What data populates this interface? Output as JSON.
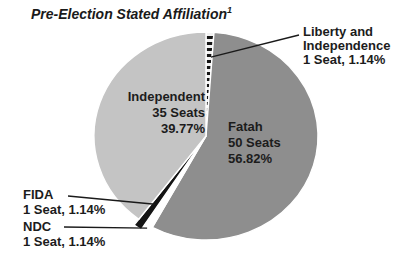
{
  "title": {
    "text": "Pre-Election Stated Affiliation",
    "superscript": "1"
  },
  "chart_data": {
    "type": "pie",
    "title": "Pre-Election Stated Affiliation",
    "footnote_marker": "1",
    "unit": "Seats",
    "total_seats": 88,
    "start_angle_deg": 0,
    "direction": "clockwise",
    "legend_position": "none",
    "slices": [
      {
        "id": "liberty-and-independence",
        "label": "Liberty and Independence",
        "seats": 1,
        "pct": 1.14,
        "fill": "stripes",
        "explode": false
      },
      {
        "id": "fatah",
        "label": "Fatah",
        "seats": 50,
        "pct": 56.82,
        "fill": "#8e8e8e",
        "explode": false
      },
      {
        "id": "ndc",
        "label": "NDC",
        "seats": 1,
        "pct": 1.14,
        "fill": "#ffffff",
        "explode": true
      },
      {
        "id": "fida",
        "label": "FIDA",
        "seats": 1,
        "pct": 1.14,
        "fill": "#141414",
        "explode": true
      },
      {
        "id": "independent",
        "label": "Independent",
        "seats": 35,
        "pct": 39.77,
        "fill": "#c4c4c4",
        "explode": false
      }
    ]
  },
  "labels": {
    "independent": {
      "line1": "Independent",
      "line2": "35 Seats",
      "line3": "39.77%"
    },
    "fatah": {
      "line1": "Fatah",
      "line2": "50 Seats",
      "line3": "56.82%"
    },
    "liberty": {
      "line1": "Liberty and",
      "line2": "Independence",
      "line3": "1 Seat, 1.14%"
    },
    "fida": {
      "line1": "FIDA",
      "line2": "1 Seat, 1.14%"
    },
    "ndc": {
      "line1": "NDC",
      "line2": "1 Seat, 1.14%"
    }
  },
  "colors": {
    "independent": "#c4c4c4",
    "fatah": "#8e8e8e",
    "fida": "#141414",
    "ndc": "#ffffff",
    "stripe_dark": "#141414",
    "stripe_light": "#f2f2f2",
    "text": "#1c1c1c",
    "leader_line": "#1a1a1a",
    "separator": "#ffffff",
    "background": "#ffffff"
  }
}
